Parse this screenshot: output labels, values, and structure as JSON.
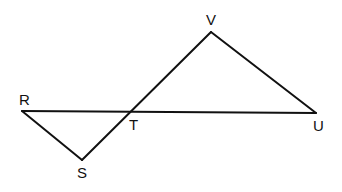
{
  "diagram": {
    "type": "geometry",
    "points": {
      "R": {
        "x": 22,
        "y": 111,
        "label": "R"
      },
      "S": {
        "x": 82,
        "y": 160,
        "label": "S"
      },
      "T": {
        "x": 131,
        "y": 112,
        "label": "T"
      },
      "V": {
        "x": 211,
        "y": 32,
        "label": "V"
      },
      "U": {
        "x": 316,
        "y": 113,
        "label": "U"
      }
    },
    "segments": [
      {
        "from": "R",
        "to": "U"
      },
      {
        "from": "R",
        "to": "S"
      },
      {
        "from": "S",
        "to": "V"
      },
      {
        "from": "V",
        "to": "U"
      }
    ],
    "labels": {
      "R": "R",
      "S": "S",
      "T": "T",
      "U": "U",
      "V": "V"
    },
    "stroke_color": "#111111",
    "background_color": "#ffffff"
  }
}
